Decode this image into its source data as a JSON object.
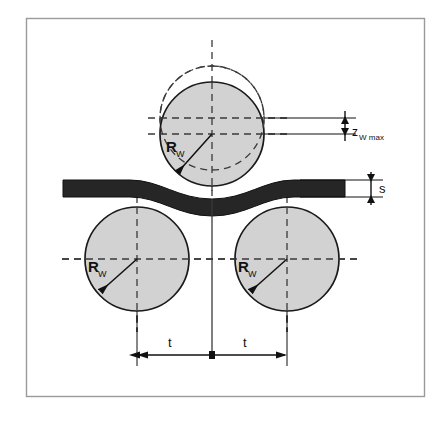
{
  "figure": {
    "name": "three-roll-bending-diagram",
    "background_color": "#ffffff",
    "frame": {
      "stroke_color": "#9a9a9a",
      "x": 26,
      "y": 18,
      "width": 399,
      "height": 379
    },
    "colors": {
      "roll_fill": "#d2d2d2",
      "roll_stroke": "#1a1a1a",
      "strip_fill": "#262626",
      "dashed_line": "#3a3a3a",
      "dimension_line": "#111111",
      "label_text": "#111111",
      "frame_stroke": "#9a9a9a"
    },
    "labels": {
      "roll_radius": "R",
      "roll_radius_sub": "W",
      "deflection": "z",
      "deflection_sub": "W max",
      "strip_thickness": "s",
      "pitch": "t"
    },
    "rolls": [
      {
        "id": "top-roll-deflected",
        "cx": 212,
        "cy": 134,
        "r": 52,
        "style": "solid",
        "label": "R_W"
      },
      {
        "id": "top-roll-original",
        "cx": 212,
        "cy": 118,
        "r": 52,
        "style": "dashed",
        "label": ""
      },
      {
        "id": "bottom-left-roll",
        "cx": 137,
        "cy": 259,
        "r": 52,
        "style": "solid",
        "label": "R_W"
      },
      {
        "id": "bottom-right-roll",
        "cx": 287,
        "cy": 259,
        "r": 52,
        "style": "solid",
        "label": "R_W"
      }
    ],
    "dimensions": [
      {
        "id": "z-w-max",
        "type": "vertical",
        "label": "z_W max",
        "from_y": 118,
        "to_y": 134,
        "x": 345
      },
      {
        "id": "strip-thickness-s",
        "type": "vertical",
        "label": "s",
        "from_y": 180,
        "to_y": 197,
        "x": 371
      },
      {
        "id": "pitch-left-t",
        "type": "horizontal",
        "label": "t",
        "from_x": 137,
        "to_x": 212,
        "y": 355
      },
      {
        "id": "pitch-right-t",
        "type": "horizontal",
        "label": "t",
        "from_x": 212,
        "to_x": 287,
        "y": 355
      }
    ],
    "strip": {
      "id": "sheet-strip",
      "description": "dark wavy sheet strip bent between rolls",
      "thickness": 17,
      "left_x": 63,
      "right_x": 345
    }
  }
}
